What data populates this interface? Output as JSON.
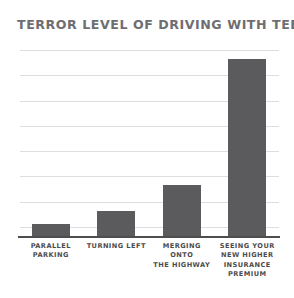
{
  "chart_data": {
    "type": "bar",
    "title": "TERROR LEVEL OF DRIVING WITH TEENS",
    "xlabel": "",
    "ylabel": "",
    "categories": [
      "PARALLEL PARKING",
      "TURNING LEFT",
      "MERGING ONTO THE HIGHWAY",
      "SEEING YOUR NEW HIGHER INSURANCE PREMIUM"
    ],
    "category_lines": [
      [
        "PARALLEL",
        "PARKING"
      ],
      [
        "TURNING LEFT"
      ],
      [
        "MERGING ONTO",
        "THE HIGHWAY"
      ],
      [
        "SEEING YOUR",
        "NEW HIGHER",
        "INSURANCE",
        "PREMIUM"
      ]
    ],
    "values": [
      0.6,
      1.1,
      2.2,
      7.4
    ],
    "ylim": [
      0,
      8
    ],
    "grid": true,
    "gridline_count": 8,
    "tick_labels": [],
    "legend": null,
    "legend_position": "none",
    "bar_color": "#5b5b5d",
    "grid_color": "#dedee1",
    "axis_color": "#4e4e4e",
    "title_color": "#6e6e72",
    "label_color": "#4b4b4d",
    "background_color": "#ffffff"
  }
}
